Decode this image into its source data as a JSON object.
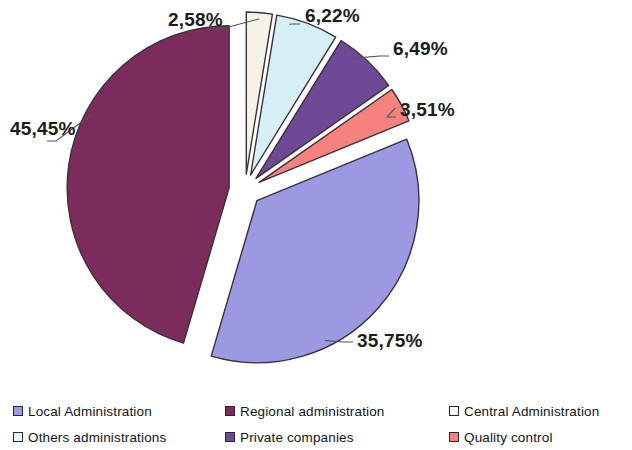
{
  "chart_data": {
    "type": "pie",
    "title": "",
    "subtitle": "",
    "xlabel": "",
    "ylabel": "",
    "exploded": true,
    "legend_position": "bottom",
    "grid": false,
    "value_suffix": "%",
    "decimal_separator": ",",
    "categories": [
      "Local Administration",
      "Regional administration",
      "Central Administration",
      "Others administrations",
      "Private companies",
      "Quality control"
    ],
    "values": [
      35.75,
      45.45,
      2.58,
      6.22,
      6.49,
      3.51
    ],
    "labels": [
      "35,75%",
      "45,45%",
      "2,58%",
      "6,22%",
      "6,49%",
      "3,51%"
    ],
    "colors": [
      "#9d98e2",
      "#7b2c5c",
      "#f4f3e6",
      "#d5eff5",
      "#6e4a96",
      "#f5827f"
    ],
    "slices": [
      {
        "name": "Central Administration",
        "label": "2,58%",
        "value": 2.58,
        "color": "#f4f3e6",
        "label_x": 168,
        "label_y": 9
      },
      {
        "name": "Others administrations",
        "label": "6,22%",
        "value": 6.22,
        "color": "#d5eff5",
        "label_x": 305,
        "label_y": 5
      },
      {
        "name": "Private companies",
        "label": "6,49%",
        "value": 6.49,
        "color": "#6e4a96",
        "label_x": 393,
        "label_y": 38
      },
      {
        "name": "Quality control",
        "label": "3,51%",
        "value": 3.51,
        "color": "#f5827f",
        "label_x": 400,
        "label_y": 99
      },
      {
        "name": "Local Administration",
        "label": "35,75%",
        "value": 35.75,
        "color": "#9d98e2",
        "label_x": 357,
        "label_y": 330
      },
      {
        "name": "Regional administration",
        "label": "45,45%",
        "value": 45.45,
        "color": "#7b2c5c",
        "label_x": 10,
        "label_y": 118
      }
    ]
  },
  "legend": {
    "items": [
      {
        "label": "Local Administration",
        "color": "#9d98e2"
      },
      {
        "label": "Regional administration",
        "color": "#7b2c5c"
      },
      {
        "label": "Central Administration",
        "color": "#f9f8f1"
      },
      {
        "label": "Others administrations",
        "color": "#eaf8fb"
      },
      {
        "label": "Private companies",
        "color": "#6e4a96"
      },
      {
        "label": "Quality control",
        "color": "#f5827f"
      }
    ]
  }
}
